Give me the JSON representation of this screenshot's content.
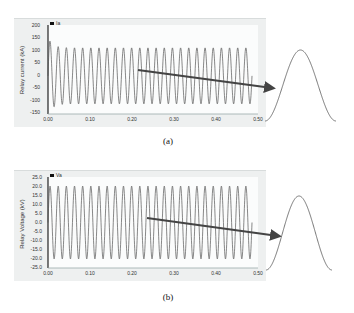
{
  "figure": {
    "panels": [
      {
        "id": "a",
        "caption": "(a)",
        "legend": "Ia",
        "ylabel": "Relay current (kA)",
        "yticks": [
          "200",
          "150",
          "100",
          "50",
          "0",
          "-50",
          "-100",
          "-150"
        ],
        "xticks": [
          "0.00",
          "0.10",
          "0.20",
          "0.30",
          "0.40",
          "0.50"
        ]
      },
      {
        "id": "b",
        "caption": "(b)",
        "legend": "Va",
        "ylabel": "Relay Voltage (kV)",
        "yticks": [
          "25.0",
          "20.0",
          "15.0",
          "10.0",
          "5.0",
          "0.0",
          "-5.0",
          "-10.0",
          "-15.0",
          "-20.0",
          "-25.0"
        ],
        "xticks": [
          "0.00",
          "0.10",
          "0.20",
          "0.30",
          "0.40",
          "0.50"
        ]
      }
    ]
  },
  "chart_data": [
    {
      "type": "line",
      "title": "(a)",
      "xlabel": "Time (s)",
      "ylabel": "Relay current (kA)",
      "xlim": [
        0,
        0.5
      ],
      "ylim": [
        -150,
        200
      ],
      "xticks": [
        0.0,
        0.1,
        0.2,
        0.3,
        0.4,
        0.5
      ],
      "yticks": [
        200,
        150,
        100,
        50,
        0,
        -50,
        -100,
        -150
      ],
      "grid": false,
      "legend": [
        "Ia"
      ],
      "legend_position": "top-left",
      "series": [
        {
          "name": "Ia",
          "waveform": "sinusoid",
          "frequency_hz": 50,
          "cycles": 25,
          "first_peak": 150,
          "steady_amplitude": 110,
          "offset": 0
        }
      ],
      "annotation": "Arrow pointing to an enlarged single cycle of the waveform at right"
    },
    {
      "type": "line",
      "title": "(b)",
      "xlabel": "Time (s)",
      "ylabel": "Relay Voltage (kV)",
      "xlim": [
        0,
        0.5
      ],
      "ylim": [
        -25,
        25
      ],
      "xticks": [
        0.0,
        0.1,
        0.2,
        0.3,
        0.4,
        0.5
      ],
      "yticks": [
        25,
        20,
        15,
        10,
        5,
        0,
        -5,
        -10,
        -15,
        -20,
        -25
      ],
      "grid": false,
      "legend": [
        "Va"
      ],
      "legend_position": "top-left",
      "series": [
        {
          "name": "Va",
          "waveform": "sinusoid",
          "frequency_hz": 50,
          "cycles": 25,
          "amplitude": 20,
          "offset": 0
        }
      ],
      "annotation": "Arrow pointing to an enlarged single cycle of the waveform at right"
    }
  ]
}
